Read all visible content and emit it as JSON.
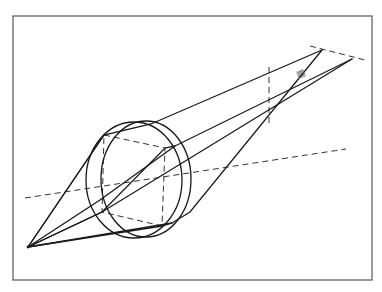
{
  "diagram": {
    "title": "",
    "type": "optics-lens-ray-diagram",
    "frame": {
      "x": 13,
      "y": 16,
      "w": 359,
      "h": 264
    },
    "colors": {
      "line": "#1a1a1a",
      "dash": "#333333",
      "frame": "#555555",
      "background": "#ffffff"
    },
    "object_point": {
      "x": 28,
      "y": 247
    },
    "image_plane": {
      "x1": 310,
      "y1": 46,
      "x2": 365,
      "y2": 60
    },
    "image_apex_top": {
      "x": 322,
      "y": 50
    },
    "image_apex_right": {
      "x": 352,
      "y": 59
    },
    "image_spot": {
      "x": 301,
      "y": 74,
      "size": 7
    },
    "optical_axis": {
      "x1": 25,
      "y1": 198,
      "x2": 346,
      "y2": 149
    },
    "aperture_stop": {
      "x1": 269,
      "y1": 67,
      "x2": 269,
      "y2": 127
    },
    "lens": {
      "back_ellipse": {
        "cx": 134,
        "cy": 180,
        "rx": 48,
        "ry": 58
      },
      "front_ellipse": {
        "cx": 146,
        "cy": 179,
        "rx": 45,
        "ry": 58
      },
      "inner_quad": [
        {
          "x": 104,
          "y": 135
        },
        {
          "x": 165,
          "y": 148
        },
        {
          "x": 162,
          "y": 226
        },
        {
          "x": 102,
          "y": 212
        }
      ]
    },
    "rays": [
      {
        "points": [
          [
            28,
            247
          ],
          [
            104,
            135
          ],
          [
            151,
            124
          ],
          [
            322,
            50
          ]
        ]
      },
      {
        "points": [
          [
            28,
            247
          ],
          [
            102,
            212
          ],
          [
            165,
            148
          ],
          [
            175,
            146
          ],
          [
            352,
            59
          ]
        ]
      },
      {
        "points": [
          [
            28,
            247
          ],
          [
            104,
            135
          ]
        ]
      },
      {
        "points": [
          [
            28,
            247
          ],
          [
            162,
            226
          ],
          [
            172,
            223
          ],
          [
            190,
            212
          ],
          [
            322,
            50
          ]
        ]
      },
      {
        "points": [
          [
            28,
            247
          ],
          [
            100,
            200
          ],
          [
            175,
            146
          ]
        ]
      },
      {
        "points": [
          [
            28,
            247
          ],
          [
            102,
            212
          ],
          [
            352,
            59
          ]
        ]
      },
      {
        "points": [
          [
            28,
            247
          ],
          [
            172,
            223
          ]
        ]
      }
    ],
    "labels": []
  }
}
